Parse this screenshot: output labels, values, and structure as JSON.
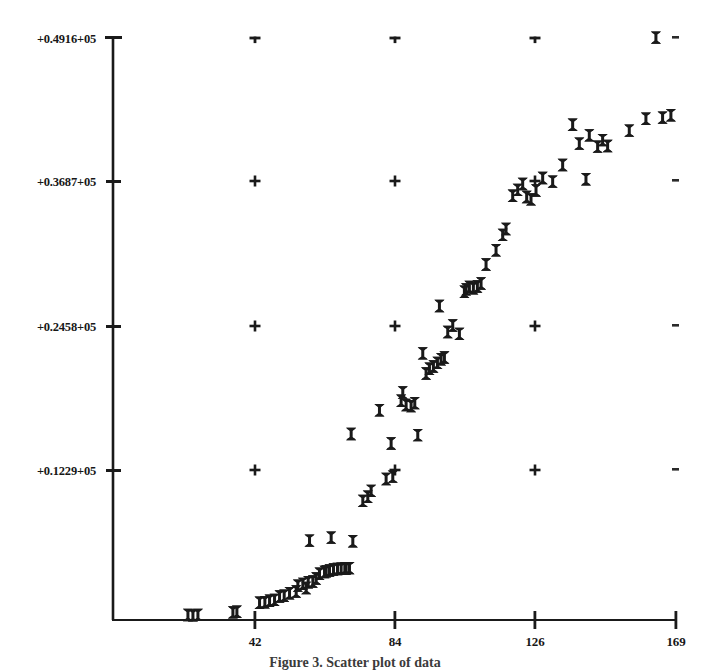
{
  "figure": {
    "caption": "Figure 3. Scatter plot of data",
    "background_color": "#ffffff",
    "ink_color": "#1a1a1a"
  },
  "chart_data": {
    "type": "scatter",
    "title": "",
    "xlabel": "",
    "ylabel": "",
    "xlim": [
      0,
      176
    ],
    "ylim": [
      0,
      51600
    ],
    "grid": true,
    "grid_style": "cross-marks-at-intersections",
    "legend": null,
    "marker": "bowtie",
    "marker_color": "#1a1a1a",
    "x_tick_labels": [
      "42",
      "84",
      "126",
      "169"
    ],
    "x_tick_values": [
      42,
      84,
      126,
      169
    ],
    "y_tick_labels": [
      "+0.1229+05",
      "+0.2458+05",
      "+0.3687+05",
      "+0.4916+05"
    ],
    "y_tick_values": [
      12290,
      24580,
      36870,
      49160
    ],
    "points": [
      [
        22.5,
        420
      ],
      [
        24.0,
        390
      ],
      [
        25.5,
        430
      ],
      [
        36.0,
        640
      ],
      [
        37.2,
        700
      ],
      [
        44.0,
        1450
      ],
      [
        45.6,
        1500
      ],
      [
        47.0,
        1620
      ],
      [
        48.5,
        1700
      ],
      [
        50.0,
        1980
      ],
      [
        51.4,
        2050
      ],
      [
        53.0,
        2260
      ],
      [
        55.5,
        2900
      ],
      [
        57.0,
        3050
      ],
      [
        58.6,
        3180
      ],
      [
        60.0,
        3250
      ],
      [
        62.0,
        3900
      ],
      [
        63.5,
        4050
      ],
      [
        65.0,
        4180
      ],
      [
        66.2,
        4260
      ],
      [
        67.4,
        4300
      ],
      [
        68.5,
        4330
      ],
      [
        69.6,
        4360
      ],
      [
        71.0,
        4380
      ],
      [
        59.0,
        6700
      ],
      [
        65.5,
        6950
      ],
      [
        72.0,
        6650
      ],
      [
        75.0,
        10050
      ],
      [
        76.5,
        10400
      ],
      [
        77.5,
        10900
      ],
      [
        82.0,
        11900
      ],
      [
        84.0,
        12100
      ],
      [
        71.5,
        15700
      ],
      [
        80.0,
        17700
      ],
      [
        86.5,
        18500
      ],
      [
        88.0,
        18150
      ],
      [
        89.5,
        18050
      ],
      [
        90.6,
        18300
      ],
      [
        83.5,
        14900
      ],
      [
        91.5,
        15600
      ],
      [
        95.0,
        21200
      ],
      [
        96.2,
        21400
      ],
      [
        97.4,
        21700
      ],
      [
        98.5,
        22000
      ],
      [
        99.5,
        22150
      ],
      [
        93.0,
        22500
      ],
      [
        100.5,
        24300
      ],
      [
        102.0,
        24850
      ],
      [
        104.0,
        24150
      ],
      [
        98.0,
        26500
      ],
      [
        105.5,
        27700
      ],
      [
        107.0,
        28100
      ],
      [
        108.2,
        28000
      ],
      [
        109.4,
        28150
      ],
      [
        110.5,
        28400
      ],
      [
        112.0,
        30000
      ],
      [
        115.0,
        31200
      ],
      [
        118.0,
        33000
      ],
      [
        120.0,
        35800
      ],
      [
        121.5,
        36300
      ],
      [
        123.0,
        36800
      ],
      [
        124.2,
        35700
      ],
      [
        125.5,
        35500
      ],
      [
        127.0,
        36250
      ],
      [
        129.0,
        37300
      ],
      [
        132.0,
        37000
      ],
      [
        138.0,
        41800
      ],
      [
        140.0,
        40200
      ],
      [
        143.0,
        40900
      ],
      [
        145.5,
        39950
      ],
      [
        147.0,
        40500
      ],
      [
        148.5,
        40000
      ],
      [
        142.0,
        37200
      ],
      [
        155.0,
        41300
      ],
      [
        160.0,
        42300
      ],
      [
        165.0,
        42400
      ],
      [
        167.5,
        42600
      ],
      [
        163.0,
        49150
      ],
      [
        55.0,
        2400
      ],
      [
        58.0,
        2700
      ],
      [
        61.0,
        3500
      ],
      [
        64.0,
        4100
      ],
      [
        70.0,
        4350
      ],
      [
        87.0,
        19200
      ],
      [
        94.0,
        20800
      ],
      [
        106.0,
        27900
      ],
      [
        117.0,
        32500
      ],
      [
        135.0,
        38400
      ]
    ]
  }
}
